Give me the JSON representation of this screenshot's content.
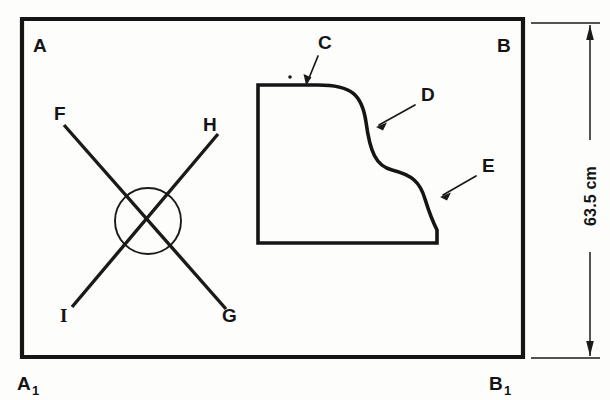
{
  "figure": {
    "background_color": "#fdfdfc",
    "ink_color": "#151515"
  },
  "frame": {
    "name": "outer-rectangle",
    "corner_labels": {
      "top_left": "A",
      "top_right": "B",
      "bottom_left": "A",
      "bottom_left_subscript": "1",
      "bottom_right": "B",
      "bottom_right_subscript": "1"
    }
  },
  "cross": {
    "name": "crossed-lines-with-circle",
    "endpoint_labels": {
      "upper_left": "F",
      "upper_right": "H",
      "lower_left": "I",
      "lower_right": "G"
    }
  },
  "profile_block": {
    "name": "ogee-profile-block",
    "leader_labels": {
      "top_edge": "C",
      "upper_curve": "D",
      "lower_curve": "E"
    }
  },
  "dimension": {
    "name": "vertical-height-dimension",
    "value": "63.5 cm",
    "orientation": "vertical"
  }
}
